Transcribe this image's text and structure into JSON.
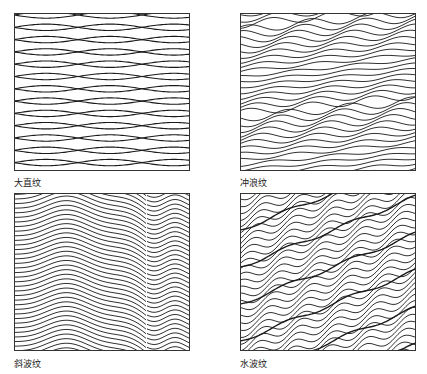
{
  "figure": {
    "panels": [
      {
        "id": "big-straight",
        "label": "大直纹",
        "box": [
          14,
          13,
          176,
          158
        ],
        "label_pos": [
          14,
          176
        ],
        "style": "lens",
        "spacing": 12.3,
        "amplitude": 3.2,
        "wavelength": 128,
        "phase": 0
      },
      {
        "id": "surf",
        "label": "冲浪纹",
        "box": [
          240,
          13,
          176,
          158
        ],
        "label_pos": [
          240,
          176
        ],
        "style": "surf",
        "spacing": 5.2,
        "amplitude": 3.5,
        "wavelength": 62,
        "slope": 0.1
      },
      {
        "id": "oblique-wave",
        "label": "斜波纹",
        "box": [
          14,
          193,
          176,
          158
        ],
        "label_pos": [
          14,
          357
        ],
        "style": "oblique",
        "spacing": 4.6,
        "amplitude": 5,
        "break_x": 133
      },
      {
        "id": "water-wave",
        "label": "水波纹",
        "box": [
          240,
          193,
          176,
          158
        ],
        "label_pos": [
          240,
          357
        ],
        "style": "water",
        "spacing": 6.2,
        "amplitude": 4.5,
        "wavelength": 40,
        "slope": -0.38
      }
    ],
    "stroke_color": "#1a1a1a",
    "frame_color": "#333333"
  }
}
